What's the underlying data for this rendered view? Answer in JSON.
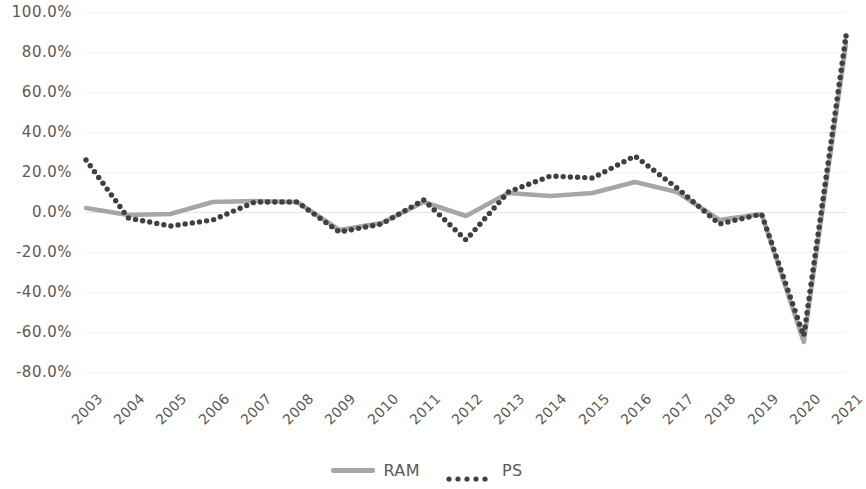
{
  "chart_data": {
    "type": "line",
    "title": "",
    "subtitle": "",
    "xlabel": "",
    "ylabel": "",
    "grid": true,
    "legend_position": "bottom",
    "ylim": [
      -80,
      100
    ],
    "ytick_step": 20,
    "ytick_labels": [
      "100.0%",
      "80.0%",
      "60.0%",
      "40.0%",
      "20.0%",
      "0.0%",
      "-20.0%",
      "-40.0%",
      "-60.0%",
      "-80.0%"
    ],
    "ytick_values": [
      100,
      80,
      60,
      40,
      20,
      0,
      -20,
      -40,
      -60,
      -80
    ],
    "categories": [
      "2003",
      "2004",
      "2005",
      "2006",
      "2007",
      "2008",
      "2009",
      "2010",
      "2011",
      "2012",
      "2013",
      "2014",
      "2015",
      "2016",
      "2017",
      "2018",
      "2019",
      "2020",
      "2021"
    ],
    "series": [
      {
        "name": "RAM",
        "color": "#a6a6a6",
        "style": "solid",
        "values": [
          2.0,
          -1.5,
          -1.0,
          5.0,
          5.5,
          5.0,
          -9.0,
          -5.5,
          5.0,
          -2.0,
          9.5,
          8.0,
          9.5,
          15.0,
          10.0,
          -4.0,
          -1.0,
          -65.0,
          84.0
        ]
      },
      {
        "name": "PS",
        "color": "#404040",
        "style": "dotted",
        "values": [
          26.0,
          -3.0,
          -7.0,
          -4.0,
          5.0,
          5.0,
          -10.0,
          -6.0,
          6.0,
          -14.0,
          10.0,
          18.0,
          17.0,
          28.0,
          12.0,
          -6.0,
          -1.0,
          -62.0,
          88.0
        ]
      }
    ]
  },
  "legend": {
    "items": [
      {
        "label": "RAM",
        "swatch": "solid-line-swatch"
      },
      {
        "label": "PS",
        "swatch": "dotted-line-swatch"
      }
    ]
  }
}
